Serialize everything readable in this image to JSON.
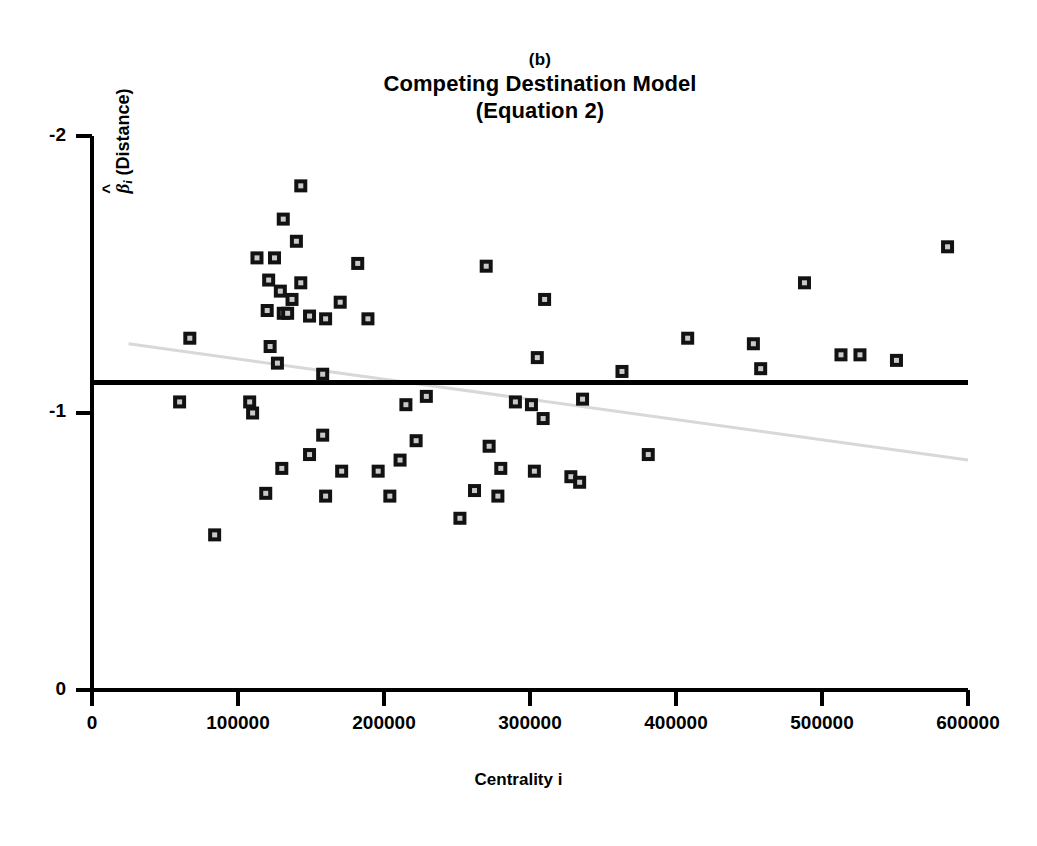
{
  "title": {
    "panel_label": "(b)",
    "main": "Competing Destination Model",
    "sub": "(Equation 2)"
  },
  "axes": {
    "y_label_symbol": "β",
    "y_label_subscript": "i",
    "y_label_paren": "(Distance)",
    "x_label": "Centrality i",
    "y_ticks": [
      "-2",
      "-1",
      "0"
    ],
    "x_ticks": [
      "0",
      "100000",
      "200000",
      "300000",
      "400000",
      "500000",
      "600000"
    ]
  },
  "colors": {
    "marker_outer": "#121212",
    "marker_inner": "#c9c9c9",
    "axis": "#000000",
    "reference_line": "#000000",
    "trend_line": "#d8d8d8",
    "background": "#ffffff"
  },
  "chart_data": {
    "type": "scatter",
    "title": "Competing Destination Model (Equation 2)",
    "subtitle": "(b)",
    "xlabel": "Centrality i",
    "ylabel": "β̂i (Distance)",
    "xlim": [
      0,
      600000
    ],
    "ylim": [
      -2,
      0
    ],
    "y_axis_inverted": true,
    "grid": false,
    "legend": null,
    "xticks": [
      0,
      100000,
      200000,
      300000,
      400000,
      500000,
      600000
    ],
    "yticks": [
      -2,
      -1,
      0
    ],
    "reference_line": {
      "orientation": "horizontal",
      "y": -1.11,
      "x_start": 0,
      "x_end": 600000,
      "color": "#000000",
      "label": "pooled estimate"
    },
    "trend_line": {
      "x_start": 25000,
      "y_start": -1.25,
      "x_end": 600000,
      "y_end": -0.83,
      "color": "#d8d8d8",
      "style": "faint"
    },
    "points": [
      {
        "x": 143000,
        "y": -1.82
      },
      {
        "x": 131000,
        "y": -1.7
      },
      {
        "x": 140000,
        "y": -1.62
      },
      {
        "x": 113000,
        "y": -1.56
      },
      {
        "x": 125000,
        "y": -1.56
      },
      {
        "x": 182000,
        "y": -1.54
      },
      {
        "x": 270000,
        "y": -1.53
      },
      {
        "x": 121000,
        "y": -1.48
      },
      {
        "x": 143000,
        "y": -1.47
      },
      {
        "x": 129000,
        "y": -1.44
      },
      {
        "x": 137000,
        "y": -1.41
      },
      {
        "x": 310000,
        "y": -1.41
      },
      {
        "x": 170000,
        "y": -1.4
      },
      {
        "x": 120000,
        "y": -1.37
      },
      {
        "x": 131000,
        "y": -1.36
      },
      {
        "x": 134000,
        "y": -1.36
      },
      {
        "x": 149000,
        "y": -1.35
      },
      {
        "x": 160000,
        "y": -1.34
      },
      {
        "x": 189000,
        "y": -1.34
      },
      {
        "x": 67000,
        "y": -1.27
      },
      {
        "x": 122000,
        "y": -1.24
      },
      {
        "x": 408000,
        "y": -1.27
      },
      {
        "x": 453000,
        "y": -1.25
      },
      {
        "x": 513000,
        "y": -1.21
      },
      {
        "x": 526000,
        "y": -1.21
      },
      {
        "x": 551000,
        "y": -1.19
      },
      {
        "x": 127000,
        "y": -1.18
      },
      {
        "x": 305000,
        "y": -1.2
      },
      {
        "x": 488000,
        "y": -1.47
      },
      {
        "x": 586000,
        "y": -1.6
      },
      {
        "x": 158000,
        "y": -1.14
      },
      {
        "x": 363000,
        "y": -1.15
      },
      {
        "x": 458000,
        "y": -1.16
      },
      {
        "x": 60000,
        "y": -1.04
      },
      {
        "x": 108000,
        "y": -1.04
      },
      {
        "x": 110000,
        "y": -1.0
      },
      {
        "x": 229000,
        "y": -1.06
      },
      {
        "x": 215000,
        "y": -1.03
      },
      {
        "x": 290000,
        "y": -1.04
      },
      {
        "x": 301000,
        "y": -1.03
      },
      {
        "x": 309000,
        "y": -0.98
      },
      {
        "x": 336000,
        "y": -1.05
      },
      {
        "x": 158000,
        "y": -0.92
      },
      {
        "x": 222000,
        "y": -0.9
      },
      {
        "x": 272000,
        "y": -0.88
      },
      {
        "x": 149000,
        "y": -0.85
      },
      {
        "x": 211000,
        "y": -0.83
      },
      {
        "x": 381000,
        "y": -0.85
      },
      {
        "x": 130000,
        "y": -0.8
      },
      {
        "x": 171000,
        "y": -0.79
      },
      {
        "x": 196000,
        "y": -0.79
      },
      {
        "x": 280000,
        "y": -0.8
      },
      {
        "x": 303000,
        "y": -0.79
      },
      {
        "x": 328000,
        "y": -0.77
      },
      {
        "x": 334000,
        "y": -0.75
      },
      {
        "x": 119000,
        "y": -0.71
      },
      {
        "x": 160000,
        "y": -0.7
      },
      {
        "x": 204000,
        "y": -0.7
      },
      {
        "x": 262000,
        "y": -0.72
      },
      {
        "x": 278000,
        "y": -0.7
      },
      {
        "x": 252000,
        "y": -0.62
      },
      {
        "x": 84000,
        "y": -0.56
      }
    ]
  }
}
